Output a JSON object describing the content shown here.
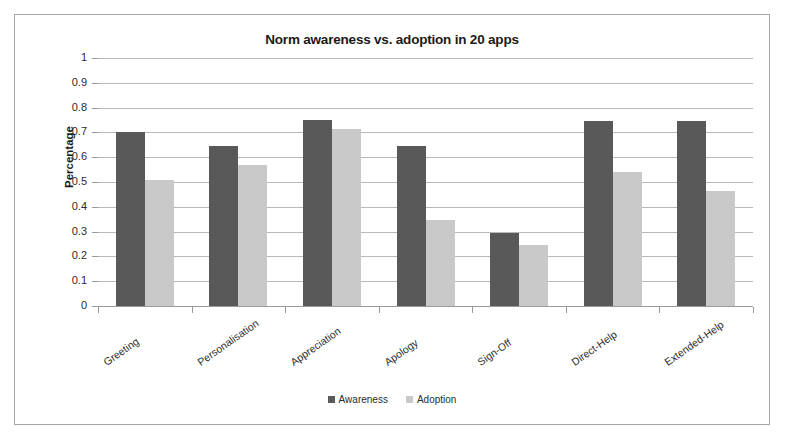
{
  "chart_data": {
    "type": "bar",
    "title": "Norm awareness vs. adoption in 20 apps",
    "xlabel": "",
    "ylabel": "Percentage",
    "ylim": [
      0,
      1
    ],
    "ytick_step": 0.1,
    "ytick_labels": [
      "1",
      "0.9",
      "0.8",
      "0.7",
      "0.6",
      "0.5",
      "0.4",
      "0.3",
      "0.2",
      "0.1",
      "0"
    ],
    "grid": true,
    "legend_position": "bottom",
    "categories": [
      "Greeting",
      "Personalisation",
      "Appreciation",
      "Apology",
      "Sign-Off",
      "Direct-Help",
      "Extended-Help"
    ],
    "series": [
      {
        "name": "Awareness",
        "color": "#595959",
        "values": [
          0.7,
          0.645,
          0.75,
          0.645,
          0.295,
          0.745,
          0.745
        ]
      },
      {
        "name": "Adoption",
        "color": "#c9c9c9",
        "values": [
          0.51,
          0.57,
          0.715,
          0.345,
          0.245,
          0.54,
          0.465
        ]
      }
    ]
  },
  "frame": {
    "border_color": "#a6a6a6"
  }
}
